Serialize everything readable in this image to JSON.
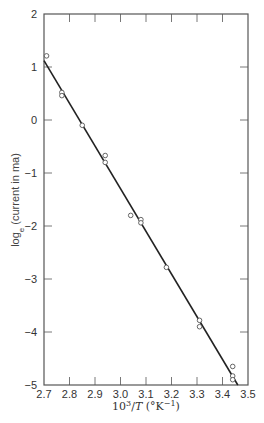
{
  "chart_data": {
    "type": "scatter",
    "title": "",
    "xlabel": "10^3/T (°K^-1)",
    "xlabel_parts": {
      "base": "10",
      "sup": "3",
      "slash": "/",
      "var": "T",
      "unit_open": " (°K",
      "unit_sup": "−1",
      "unit_close": ")"
    },
    "ylabel": "log_e (current in ma)",
    "ylabel_parts": {
      "pre": "log",
      "sub": "e",
      "post": " (current in ma)"
    },
    "xlim": [
      2.7,
      3.5
    ],
    "ylim": [
      -5,
      2
    ],
    "xticks": [
      2.7,
      2.8,
      2.9,
      3.0,
      3.1,
      3.2,
      3.3,
      3.4,
      3.5
    ],
    "xtick_labels": [
      "2.7",
      "2.8",
      "2.9",
      "3.0",
      "3.1",
      "3.2",
      "3.3",
      "3.4",
      "3.5"
    ],
    "yticks": [
      2,
      1,
      0,
      -1,
      -2,
      -3,
      -4,
      -5
    ],
    "ytick_labels": [
      "2",
      "1",
      "0",
      "−1",
      "−2",
      "−3",
      "−4",
      "−5"
    ],
    "grid": false,
    "legend": null,
    "series": [
      {
        "name": "measured",
        "marker": "open-circle",
        "points": [
          {
            "x": 2.71,
            "y": 1.21
          },
          {
            "x": 2.77,
            "y": 0.52
          },
          {
            "x": 2.77,
            "y": 0.46
          },
          {
            "x": 2.85,
            "y": -0.1
          },
          {
            "x": 2.94,
            "y": -0.67
          },
          {
            "x": 2.94,
            "y": -0.8
          },
          {
            "x": 3.04,
            "y": -1.8
          },
          {
            "x": 3.08,
            "y": -1.88
          },
          {
            "x": 3.08,
            "y": -1.94
          },
          {
            "x": 3.18,
            "y": -2.78
          },
          {
            "x": 3.31,
            "y": -3.78
          },
          {
            "x": 3.31,
            "y": -3.9
          },
          {
            "x": 3.44,
            "y": -4.65
          },
          {
            "x": 3.44,
            "y": -4.83
          },
          {
            "x": 3.44,
            "y": -4.9
          }
        ]
      },
      {
        "name": "fit",
        "type": "line",
        "points": [
          {
            "x": 2.7,
            "y": 1.12
          },
          {
            "x": 3.46,
            "y": -5.0
          }
        ]
      }
    ],
    "colors": {
      "line": "#222222",
      "marker": "#555555",
      "axis": "#555555"
    }
  }
}
